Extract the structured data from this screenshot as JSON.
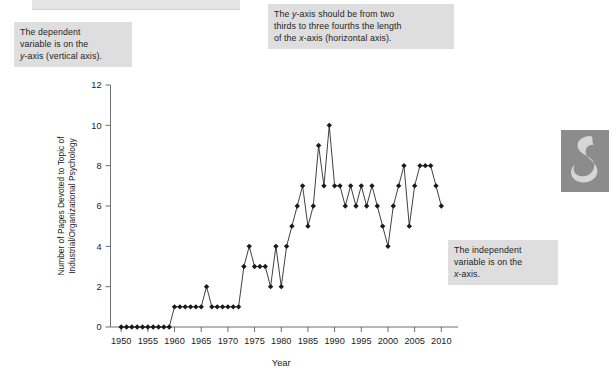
{
  "annotations": {
    "dependent": {
      "line1": "The dependent",
      "line2": "variable is on the",
      "line3": "y-axis (vertical axis)."
    },
    "yaxis_rule": {
      "line1": "The y-axis should be from two",
      "line2": "thirds to three fourths the length",
      "line3": "of the x-axis (horizontal axis)."
    },
    "independent": {
      "line1": "The independent",
      "line2": "variable is on the",
      "line3": "x-axis."
    }
  },
  "decoration": {
    "glyph_name": "ornamental-swirl",
    "background": "#8c8c8c",
    "foreground": "#d6d6d6"
  },
  "chart_data": {
    "type": "line",
    "title": "",
    "xlabel": "Year",
    "ylabel": "Number of Pages Devoted to Topic of Industrial/Organizational Psychology",
    "ylabel_line1": "Number of Pages Devoted to Topic of",
    "ylabel_line2": "Industrial/Organizational Psychology",
    "xlim": [
      1948,
      2012
    ],
    "ylim": [
      0,
      12
    ],
    "xticks": [
      1950,
      1955,
      1960,
      1965,
      1970,
      1975,
      1980,
      1985,
      1990,
      1995,
      2000,
      2005,
      2010
    ],
    "yticks": [
      0,
      2,
      4,
      6,
      8,
      10,
      12
    ],
    "grid": false,
    "legend": "none",
    "marker": "diamond",
    "line_color": "#2a2a2a",
    "marker_color": "#1a1a1a",
    "x": [
      1950,
      1951,
      1952,
      1953,
      1954,
      1955,
      1956,
      1957,
      1958,
      1959,
      1960,
      1961,
      1962,
      1963,
      1964,
      1965,
      1966,
      1967,
      1968,
      1969,
      1970,
      1971,
      1972,
      1973,
      1974,
      1975,
      1976,
      1977,
      1978,
      1979,
      1980,
      1981,
      1982,
      1983,
      1984,
      1985,
      1986,
      1987,
      1988,
      1989,
      1990,
      1991,
      1992,
      1993,
      1994,
      1995,
      1996,
      1997,
      1998,
      1999,
      2000,
      2001,
      2002,
      2003,
      2004,
      2005,
      2006,
      2007,
      2008,
      2009,
      2010
    ],
    "values": [
      0,
      0,
      0,
      0,
      0,
      0,
      0,
      0,
      0,
      0,
      1,
      1,
      1,
      1,
      1,
      1,
      2,
      1,
      1,
      1,
      1,
      1,
      1,
      3,
      4,
      3,
      3,
      3,
      2,
      4,
      2,
      4,
      5,
      6,
      7,
      5,
      6,
      9,
      7,
      10,
      7,
      7,
      6,
      7,
      6,
      7,
      6,
      7,
      6,
      5,
      4,
      6,
      7,
      8,
      5,
      7,
      8,
      8,
      8,
      7,
      6
    ]
  }
}
